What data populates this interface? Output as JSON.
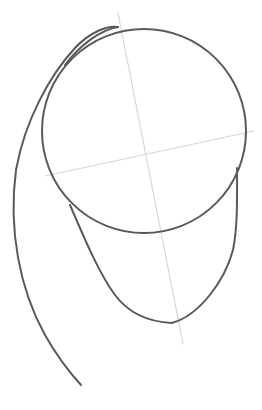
{
  "drawing": {
    "subject": "head construction sketch",
    "colors": {
      "ink": "#5a5a5a",
      "guide": "#d6d6d6",
      "background": "#ffffff"
    },
    "shapes": {
      "cranium_circle": {
        "cx": 144,
        "cy": 131,
        "r": 102
      },
      "vertical_guide": {
        "x1": 118,
        "y1": 13,
        "x2": 183,
        "y2": 344
      },
      "horizontal_guide": {
        "x1": 45,
        "y1": 176,
        "x2": 254,
        "y2": 131
      }
    }
  }
}
